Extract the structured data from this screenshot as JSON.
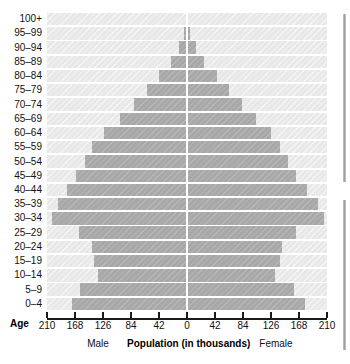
{
  "chart_data": {
    "type": "bar",
    "subtype": "population-pyramid",
    "title": "Population (in thousands)",
    "xlabel": "Population (in thousands)",
    "ylabel": "Age",
    "grid": false,
    "legend_position": "bottom",
    "xlim": [
      -210,
      210
    ],
    "xtick_values": [
      -210,
      -168,
      -126,
      -84,
      -42,
      0,
      42,
      84,
      126,
      168,
      210
    ],
    "xtick_labels": [
      "210",
      "168",
      "126",
      "84",
      "42",
      "0",
      "42",
      "84",
      "126",
      "168",
      "210"
    ],
    "categories": [
      "100+",
      "95–99",
      "90–94",
      "85–89",
      "80–84",
      "75–79",
      "70–74",
      "65–69",
      "60–64",
      "55–59",
      "50–54",
      "45–49",
      "40–44",
      "35–39",
      "30–34",
      "25–29",
      "20–24",
      "15–19",
      "10–14",
      "5–9",
      "0–4"
    ],
    "series": [
      {
        "name": "Male",
        "side": "left",
        "values": [
          1,
          4,
          12,
          24,
          42,
          60,
          79,
          101,
          124,
          142,
          153,
          166,
          180,
          194,
          202,
          162,
          143,
          140,
          134,
          161,
          173
        ]
      },
      {
        "name": "Female",
        "side": "right",
        "values": [
          1,
          4,
          13,
          26,
          45,
          63,
          82,
          104,
          126,
          140,
          152,
          163,
          180,
          196,
          206,
          163,
          142,
          139,
          132,
          160,
          177
        ]
      }
    ],
    "colors": {
      "bar": "#a8a8a8",
      "band": "#e8e8e8",
      "axis": "#1a1a1a",
      "text": "#111111",
      "centerline": "#ffffff"
    }
  },
  "labels": {
    "age_axis": "Age",
    "male": "Male",
    "female": "Female",
    "main": "Population (in thousands)"
  }
}
